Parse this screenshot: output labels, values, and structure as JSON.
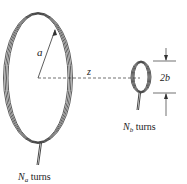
{
  "diagram": {
    "large_coil": {
      "radius_label": "a",
      "turns_symbol": "N",
      "turns_subscript": "a",
      "turns_text": " turns"
    },
    "small_coil": {
      "diameter_label": "2b",
      "turns_symbol": "N",
      "turns_subscript": "b",
      "turns_text": " turns"
    },
    "axis": {
      "distance_label": "z"
    },
    "colors": {
      "line": "#333333",
      "background": "#ffffff"
    }
  }
}
